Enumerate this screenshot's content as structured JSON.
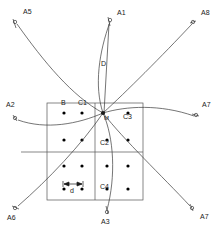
{
  "figure": {
    "type": "technical-diagram",
    "background_color": "#ffffff",
    "stroke_color": "#3a3a3a",
    "grid_line_color": "#555555",
    "dot_color": "#000000"
  },
  "grid": {
    "box": {
      "x": 47,
      "y": 103,
      "width": 96,
      "height": 97
    },
    "center_vertical_line_x": 95,
    "center_horizontal_line_y": 152,
    "outer_horizontal_line": {
      "x1": 21,
      "x2": 143,
      "y": 152
    },
    "columns": 4,
    "rows": 4,
    "dot_radius": 1.6,
    "dot_columns_x": [
      64,
      82,
      107,
      128
    ],
    "dot_rows_y": [
      113,
      140,
      166,
      189
    ]
  },
  "center_point": {
    "name": "M",
    "label": "M",
    "x": 103,
    "y": 113
  },
  "trajectories": [
    {
      "id": "A1",
      "label": "A1",
      "endpoint": {
        "x": 110,
        "y": 20
      },
      "marker_label_x": 117,
      "marker_label_y": 12
    },
    {
      "id": "A2",
      "label": "A2",
      "endpoint": {
        "x": 15,
        "y": 117
      },
      "marker_label_x": 8,
      "marker_label_y": 104
    },
    {
      "id": "A3",
      "label": "A3",
      "endpoint": {
        "x": 107,
        "y": 212
      },
      "marker_label_x": 102,
      "marker_label_y": 220
    },
    {
      "id": "A5",
      "label": "A5",
      "endpoint": {
        "x": 15,
        "y": 22
      },
      "marker_label_x": 23,
      "marker_label_y": 11
    },
    {
      "id": "A6",
      "label": "A6",
      "endpoint": {
        "x": 15,
        "y": 208
      },
      "marker_label_x": 9,
      "marker_label_y": 216
    },
    {
      "id": "A7",
      "label": "A7",
      "endpoint": {
        "x": 196,
        "y": 115
      },
      "marker_label_x": 202,
      "marker_label_y": 104
    },
    {
      "id": "A7b",
      "label": "A7",
      "endpoint": {
        "x": 192,
        "y": 208
      },
      "marker_label_x": 198,
      "marker_label_y": 215
    },
    {
      "id": "A8",
      "label": "A8",
      "endpoint": {
        "x": 193,
        "y": 22
      },
      "marker_label_x": 201,
      "marker_label_y": 12
    }
  ],
  "annotations": [
    {
      "id": "B",
      "label": "B",
      "x": 61,
      "y": 102
    },
    {
      "id": "C1",
      "label": "C1",
      "x": 79,
      "y": 102
    },
    {
      "id": "C2",
      "label": "C2",
      "x": 100,
      "y": 142
    },
    {
      "id": "C3",
      "label": "C3",
      "x": 123,
      "y": 116
    },
    {
      "id": "C4",
      "label": "C4",
      "x": 100,
      "y": 186
    },
    {
      "id": "D",
      "label": "D",
      "x": 102,
      "y": 63
    },
    {
      "id": "d",
      "label": "d",
      "x": 69,
      "y": 190
    }
  ],
  "dimension_marker": {
    "id": "d",
    "label": "d",
    "y": 184,
    "x_start": 64,
    "x_end": 82,
    "description": "Double-headed arrow spanning one grid pitch between adjacent dots"
  },
  "vertical_axis_line": {
    "label": "D",
    "x": 103,
    "y_top": 22,
    "y_bottom": 113,
    "description": "Straight vertical segment from A1 endpoint down to center point M"
  }
}
